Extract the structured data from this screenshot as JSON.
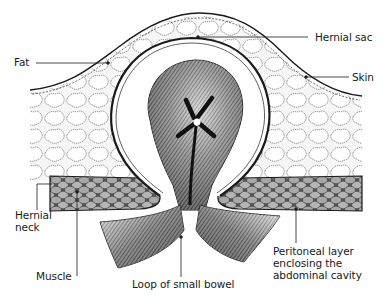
{
  "diagram": {
    "colors": {
      "ink": "#1a1a1a",
      "background": "#ffffff",
      "fat_fill": "#f4f4f4",
      "muscle_fill": "#9a9a9a",
      "bowel_dark": "#2a2a2a",
      "bowel_mid": "#6a6a6a",
      "bowel_light": "#d8d8d8"
    },
    "labels": {
      "hernial_sac": "Hernial sac",
      "fat": "Fat",
      "skin": "Skin",
      "hernial_neck_line1": "Hernial",
      "hernial_neck_line2": "neck",
      "muscle": "Muscle",
      "loop_of_small_bowel": "Loop of small bowel",
      "peritoneal_line1": "Peritoneal layer",
      "peritoneal_line2": "enclosing the",
      "peritoneal_line3": "abdominal cavity"
    }
  }
}
